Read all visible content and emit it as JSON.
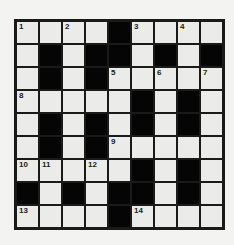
{
  "puzzle": {
    "rows": 9,
    "cols": 9,
    "layout": [
      "1.2.#3.4.",
      ".#.##.#.#",
      ".#.5.6.7",
      "8....#.#.",
      ".#.#.#.#.",
      ".#.#9....",
      "ABC.D#.#.",
      "#.#.##.#.",
      "E...#F..."
    ],
    "grid": [
      [
        {
          "n": "1"
        },
        {},
        {
          "n": "2"
        },
        {},
        {
          "b": true
        },
        {
          "n": "3"
        },
        {},
        {
          "n": "4"
        },
        {}
      ],
      [
        {},
        {
          "b": true
        },
        {},
        {
          "b": true
        },
        {
          "b": true
        },
        {},
        {
          "b": true
        },
        {},
        {
          "b": true
        }
      ],
      [
        {},
        {
          "b": true
        },
        {},
        {
          "b": true
        },
        {
          "n": "5"
        },
        {},
        {
          "n": "6"
        },
        {},
        {
          "n": "7"
        }
      ],
      [
        {
          "n": "8"
        },
        {},
        {},
        {},
        {},
        {
          "b": true
        },
        {},
        {
          "b": true
        },
        {}
      ],
      [
        {},
        {
          "b": true
        },
        {},
        {
          "b": true
        },
        {},
        {
          "b": true
        },
        {},
        {
          "b": true
        },
        {}
      ],
      [
        {},
        {
          "b": true
        },
        {},
        {
          "b": true
        },
        {
          "n": "9"
        },
        {},
        {},
        {},
        {}
      ],
      [
        {
          "n": "10"
        },
        {
          "n": "11"
        },
        {},
        {
          "n": "12"
        },
        {},
        {
          "b": true
        },
        {},
        {
          "b": true
        },
        {}
      ],
      [
        {
          "b": true
        },
        {},
        {
          "b": true
        },
        {},
        {
          "b": true
        },
        {
          "b": true
        },
        {},
        {
          "b": true
        },
        {}
      ],
      [
        {
          "n": "13"
        },
        {},
        {},
        {},
        {
          "b": true
        },
        {
          "n": "14"
        },
        {},
        {},
        {}
      ]
    ]
  },
  "colors": {
    "background": "#f3f3f1",
    "cell": "#ebebea",
    "black": "#050505",
    "line": "#1a1a1a"
  }
}
